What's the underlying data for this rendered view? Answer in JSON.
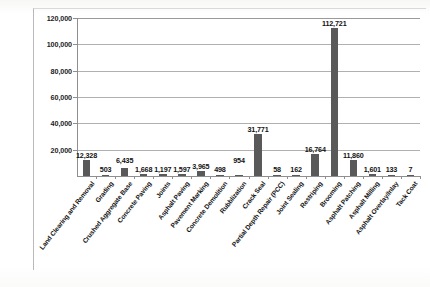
{
  "chart_data": {
    "type": "bar",
    "title": "",
    "subtitle": "",
    "xlabel": "",
    "ylabel": "",
    "ylim": [
      0,
      120000
    ],
    "ytick_values": [
      120000,
      100000,
      80000,
      60000,
      40000,
      20000
    ],
    "ytick_labels": [
      "120,000",
      "100,000",
      "80,000",
      "60,000",
      "40,000",
      "20,000"
    ],
    "grid": true,
    "legend": "none",
    "categories": [
      "Land Clearing and Removal",
      "Grading",
      "Crushed Aggregate Base",
      "Concrete Paving",
      "Joints",
      "Asphalt Paving",
      "Pavement Marking",
      "Concrete Demolition",
      "Rubblization",
      "Crack Seal",
      "Partial Depth Repair (PCC)",
      "Joint Sealing",
      "Restriping",
      "Brooming",
      "Asphalt Patching",
      "Asphalt Milling",
      "Asphalt Overlay/Inlay",
      "Tack Coat"
    ],
    "values": [
      12328,
      503,
      6435,
      1668,
      1197,
      1597,
      3965,
      498,
      954,
      31771,
      58,
      162,
      16764,
      112721,
      11860,
      1601,
      133,
      7
    ],
    "value_labels": [
      "12,328",
      "503",
      "6,435",
      "1,668",
      "1,197",
      "1,597",
      "3,965",
      "498",
      "954",
      "31,771",
      "58",
      "162",
      "16,764",
      "112,721",
      "11,860",
      "1,601",
      "133",
      "7"
    ],
    "bar_color": "#595959",
    "gridline_color": "#b0b0b0",
    "axis_color": "#8f8f8f",
    "background": "#ffffff"
  }
}
